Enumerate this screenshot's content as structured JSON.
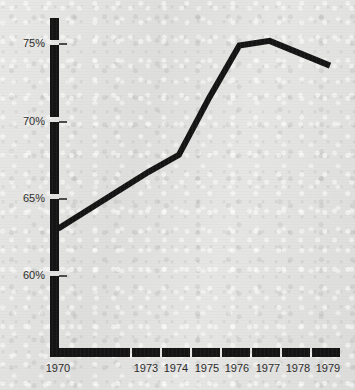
{
  "chart_data": {
    "type": "line",
    "title": "",
    "xlabel": "",
    "ylabel": "",
    "x": [
      1970,
      1973,
      1974,
      1975,
      1976,
      1977,
      1979
    ],
    "values": [
      63,
      66.7,
      67.8,
      71.5,
      74.9,
      75.2,
      73.6
    ],
    "series": [
      {
        "name": "percent",
        "values": [
          63,
          66.7,
          67.8,
          71.5,
          74.9,
          75.2,
          73.6
        ]
      }
    ],
    "xlim": [
      1970,
      1979
    ],
    "ylim": [
      58.5,
      76.5
    ],
    "grid": false,
    "legend": false,
    "line_color": "#141414",
    "axis_color": "#141414",
    "background_color": "#e4e4e2",
    "y_ticks": [
      {
        "value": 75,
        "label": "75%"
      },
      {
        "value": 70,
        "label": "70%"
      },
      {
        "value": 65,
        "label": "65%"
      },
      {
        "value": 60,
        "label": "60%"
      }
    ],
    "x_ticks": [
      {
        "value": 1970,
        "label": "1970"
      },
      {
        "value": 1973,
        "label": "1973"
      },
      {
        "value": 1974,
        "label": "1974"
      },
      {
        "value": 1975,
        "label": "1975"
      },
      {
        "value": 1976,
        "label": "1976"
      },
      {
        "value": 1977,
        "label": "1977"
      },
      {
        "value": 1978,
        "label": "1978"
      },
      {
        "value": 1979,
        "label": "1979"
      }
    ]
  }
}
